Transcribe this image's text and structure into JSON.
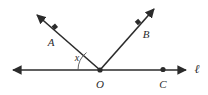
{
  "figure": {
    "type": "geometry-diagram",
    "width": 208,
    "height": 95,
    "background_color": "#ffffff",
    "stroke_color": "#2b2b2b",
    "label_color": "#2b2b2b",
    "arc_color": "#555555"
  },
  "labels": {
    "point_a": "A",
    "point_b": "B",
    "point_c": "C",
    "point_o": "O",
    "angle_x": "x",
    "line_l": "ℓ"
  },
  "geometry": {
    "vertex_o": {
      "x": 100,
      "y": 70
    },
    "line_l": {
      "name": "l",
      "start": {
        "x": 9,
        "y": 70
      },
      "end": {
        "x": 190,
        "y": 70
      },
      "arrow_both_ends": true,
      "label_position": {
        "x": 197,
        "y": 69
      }
    },
    "ray_oa": {
      "from": {
        "x": 100,
        "y": 70
      },
      "to": {
        "x": 33,
        "y": 11
      },
      "point_marker": {
        "x": 55,
        "y": 27
      },
      "label_position": {
        "x": 51,
        "y": 42
      }
    },
    "ray_ob": {
      "from": {
        "x": 100,
        "y": 70
      },
      "to": {
        "x": 158,
        "y": 5
      },
      "point_marker": {
        "x": 138,
        "y": 22
      },
      "label_position": {
        "x": 146,
        "y": 34
      }
    },
    "point_c": {
      "marker": {
        "x": 163,
        "y": 69
      },
      "label_position": {
        "x": 163,
        "y": 84
      }
    },
    "point_o_label_position": {
      "x": 100,
      "y": 84
    },
    "angle_arc": {
      "measure_label": "x",
      "label_position": {
        "x": 77,
        "y": 58
      },
      "radius": 22,
      "between": [
        "ray-oa",
        "line-l-left"
      ]
    }
  }
}
